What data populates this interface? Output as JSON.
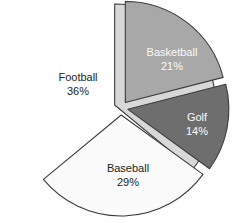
{
  "chart_data": {
    "type": "pie",
    "title": "",
    "subtitle": "",
    "xlabel": "",
    "ylabel": "",
    "grid": false,
    "legend": "none",
    "label_format": "name + percent",
    "start_angle_deg": 0,
    "direction": "clockwise",
    "exploded": true,
    "total_percent": 100,
    "categories": [
      "Football",
      "Basketball",
      "Golf",
      "Baseball"
    ],
    "values": [
      36,
      21,
      14,
      29
    ],
    "slices": [
      {
        "name": "Football",
        "value": 36,
        "percent_label": "36%",
        "color": "#d8d8d8",
        "label_color": "#242424",
        "start_deg": 0,
        "end_deg": 129.6,
        "explode_dir_deg": 295,
        "label_x": 78,
        "label_y": 83
      },
      {
        "name": "Basketball",
        "value": 21,
        "percent_label": "21%",
        "color": "#a8a8a8",
        "label_color": "#fbfbfb",
        "start_deg": 0,
        "end_deg": 75.6,
        "explode_dir_deg": 38,
        "label_x": 172,
        "label_y": 58
      },
      {
        "name": "Golf",
        "value": 14,
        "percent_label": "14%",
        "color": "#6e6e6e",
        "label_color": "#fbfbfb",
        "start_deg": 75.6,
        "end_deg": 126.0,
        "explode_dir_deg": 101,
        "label_x": 196,
        "label_y": 123
      },
      {
        "name": "Baseball",
        "value": 29,
        "percent_label": "29%",
        "color": "#fbfbfb",
        "label_color": "#242424",
        "start_deg": 126.0,
        "end_deg": 230.4,
        "explode_dir_deg": 178,
        "label_x": 128,
        "label_y": 174
      }
    ],
    "labels": {
      "football_name": "Football",
      "football_pct": "36%",
      "basketball_name": "Basketball",
      "basketball_pct": "21%",
      "golf_name": "Golf",
      "golf_pct": "14%",
      "baseball_name": "Baseball",
      "baseball_pct": "29%"
    },
    "colors": {
      "football": "#d8d8d8",
      "basketball": "#a8a8a8",
      "golf": "#6e6e6e",
      "baseball": "#fbfbfb",
      "outline": "#3c3c3c",
      "background": "#ffffff"
    },
    "geometry": {
      "center_x": 121,
      "center_y": 108,
      "radius": 101,
      "explode_offset": 7
    }
  }
}
